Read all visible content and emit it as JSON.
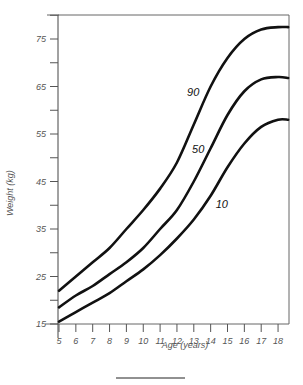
{
  "chart_data": {
    "type": "line",
    "title": "",
    "xlabel": "Age (years)",
    "ylabel": "Weight (kg)",
    "xlim": [
      5,
      18.6
    ],
    "ylim": [
      15,
      80
    ],
    "grid": false,
    "x_ticks": [
      5,
      6,
      7,
      8,
      9,
      10,
      11,
      12,
      13,
      14,
      15,
      16,
      17,
      18
    ],
    "y_ticks_labeled": [
      15,
      25,
      35,
      45,
      55,
      65,
      75
    ],
    "y_ticks_minor": [
      20,
      30,
      40,
      50,
      60,
      70,
      80
    ],
    "x": [
      5,
      6,
      7,
      8,
      9,
      10,
      11,
      12,
      13,
      14,
      15,
      16,
      17,
      18,
      18.6
    ],
    "series": [
      {
        "name": "90",
        "label_at": [
          12.6,
          63
        ],
        "values": [
          22,
          25,
          28,
          31,
          35,
          39,
          43.5,
          49,
          57,
          65,
          71,
          75,
          77,
          77.5,
          77.5
        ]
      },
      {
        "name": "50",
        "label_at": [
          12.9,
          51
        ],
        "values": [
          18.5,
          21,
          23,
          25.5,
          28,
          31,
          35,
          39,
          45,
          52,
          59,
          64,
          66.5,
          67,
          66.8
        ]
      },
      {
        "name": "10",
        "label_at": [
          14.3,
          39.5
        ],
        "values": [
          15.5,
          17.5,
          19.5,
          21.5,
          24,
          26.5,
          29.5,
          33,
          37,
          42,
          48,
          53,
          56.5,
          58,
          58
        ]
      }
    ],
    "legend": "none (inline curve labels)"
  }
}
